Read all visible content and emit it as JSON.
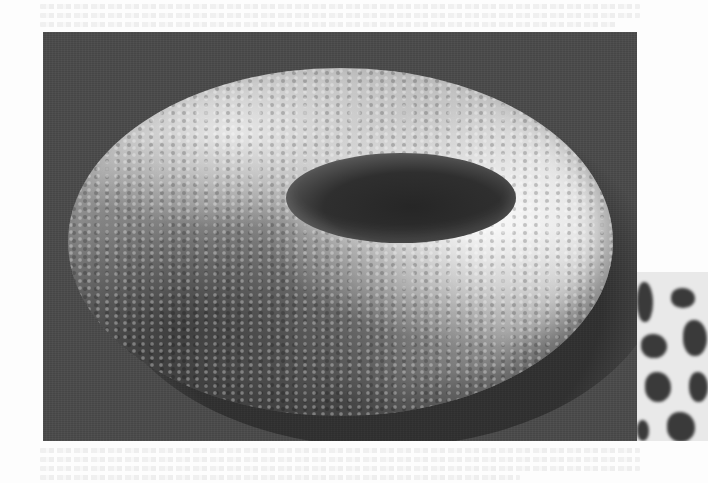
{
  "page": {
    "background_color": "#fdfdfd",
    "ghost_text_top_lines": 3,
    "ghost_text_bottom_lines": 4
  },
  "figure_main": {
    "subject": "textured-torus-render",
    "background_color": "#4a4a4a",
    "torus_highlight_color": "#e6e6e6",
    "torus_base_color": "#a8a8a8",
    "hole_color": "#2a2a2a"
  },
  "figure_inset": {
    "subject": "spotted-pattern-texture",
    "background_color": "#e9e9e9",
    "spot_color": "#3a3a3a"
  }
}
